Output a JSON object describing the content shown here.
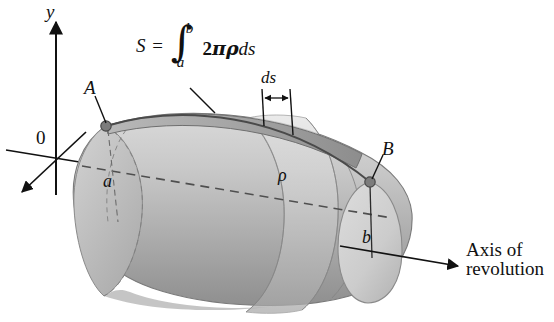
{
  "figure": {
    "background_color": "#ffffff",
    "ink_color": "#111111"
  },
  "axes": {
    "y_axis_label": "y",
    "origin_label": "0",
    "axis_of_revolution_label_line1": "Axis of",
    "axis_of_revolution_label_line2": "revolution"
  },
  "formula": {
    "lhs": "S",
    "equals": "=",
    "integral_glyph": "∫",
    "upper_limit": "b",
    "lower_limit": "a",
    "coefficient": "2",
    "pi": "π",
    "rho": "ρ",
    "differential": "ds",
    "plain_text": "S = ∫_a^b 2πρ ds"
  },
  "labels": {
    "point_a": "A",
    "point_b": "B",
    "radius_a": "a",
    "radius_b": "b",
    "rho": "ρ",
    "element_ds": "ds"
  },
  "colors": {
    "solid_light": "#d2d2d2",
    "solid_mid": "#bdbdbd",
    "solid_dark": "#9a9a9a",
    "solid_darkest": "#8a8a8a",
    "end_cap": "#cccccc",
    "outline": "#6e6e6e",
    "dash_axis": "#555555",
    "marker": "#777777"
  }
}
